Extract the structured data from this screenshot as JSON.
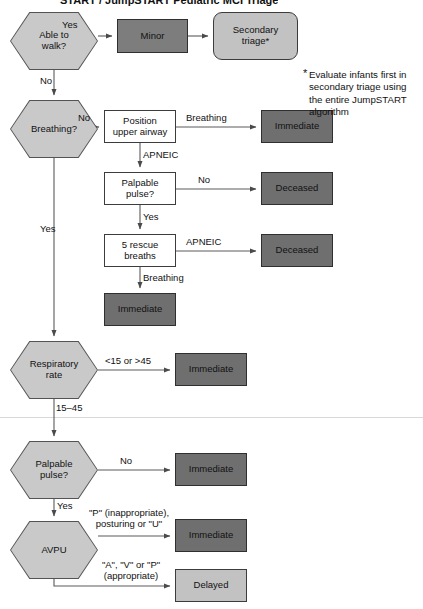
{
  "title": {
    "text": "START / JumpSTART Pediatric MCI Triage"
  },
  "footnote": {
    "marker": "*",
    "text": "Evaluate infants first in\nsecondary triage using\nthe entire JumpSTART\nalgorithm"
  },
  "colors": {
    "decision_fill": "#c9c9c9",
    "process_fill": "#ffffff",
    "immediate_fill": "#6f6f6f",
    "minor_fill": "#7d7d7d",
    "deceased_fill": "#6f6f6f",
    "delayed_fill": "#c2c2c2",
    "secondary_triage_fill": "#c2c2c2",
    "stroke": "#3c3c3c",
    "wire": "#5a5a5a",
    "text": "#111111",
    "background": "#ffffff"
  },
  "nodes": [
    {
      "id": "able-to-walk",
      "label": "Able to\nwalk?",
      "shape": "hexagon",
      "x": 10,
      "y": 12,
      "w": 88,
      "h": 58
    },
    {
      "id": "minor",
      "label": "Minor",
      "shape": "rect-mid",
      "x": 117,
      "y": 19,
      "w": 71,
      "h": 34
    },
    {
      "id": "secondary-triage",
      "label": "Secondary\ntriage*",
      "shape": "rect-rounded",
      "x": 213,
      "y": 12,
      "w": 85,
      "h": 48
    },
    {
      "id": "breathing",
      "label": "Breathing?",
      "shape": "hexagon",
      "x": 10,
      "y": 100,
      "w": 88,
      "h": 58
    },
    {
      "id": "position-airway",
      "label": "Position\nupper airway",
      "shape": "rect-plain",
      "x": 104,
      "y": 110,
      "w": 72,
      "h": 33
    },
    {
      "id": "immediate-1",
      "label": "Immediate",
      "shape": "rect-dark",
      "x": 261,
      "y": 110,
      "w": 72,
      "h": 33
    },
    {
      "id": "palpable-pulse-1",
      "label": "Palpable\npulse?",
      "shape": "rect-plain",
      "x": 104,
      "y": 172,
      "w": 72,
      "h": 33
    },
    {
      "id": "deceased-1",
      "label": "Deceased",
      "shape": "rect-dark",
      "x": 261,
      "y": 172,
      "w": 72,
      "h": 33
    },
    {
      "id": "five-rescue",
      "label": "5 rescue\nbreaths",
      "shape": "rect-plain",
      "x": 104,
      "y": 234,
      "w": 72,
      "h": 33
    },
    {
      "id": "deceased-2",
      "label": "Deceased",
      "shape": "rect-dark",
      "x": 261,
      "y": 234,
      "w": 72,
      "h": 33
    },
    {
      "id": "immediate-2",
      "label": "Immediate",
      "shape": "rect-dark",
      "x": 104,
      "y": 293,
      "w": 72,
      "h": 33
    },
    {
      "id": "respiratory-rate",
      "label": "Respiratory\nrate",
      "shape": "hexagon",
      "x": 10,
      "y": 341,
      "w": 88,
      "h": 58
    },
    {
      "id": "immediate-3",
      "label": "Immediate",
      "shape": "rect-dark",
      "x": 175,
      "y": 353,
      "w": 72,
      "h": 33
    },
    {
      "id": "palpable-pulse-2",
      "label": "Palpable\npulse?",
      "shape": "hexagon",
      "x": 10,
      "y": 441,
      "w": 88,
      "h": 58
    },
    {
      "id": "immediate-4",
      "label": "Immediate",
      "shape": "rect-dark",
      "x": 175,
      "y": 453,
      "w": 72,
      "h": 33
    },
    {
      "id": "avpu",
      "label": "AVPU",
      "shape": "hexagon",
      "x": 10,
      "y": 521,
      "w": 88,
      "h": 58
    },
    {
      "id": "immediate-5",
      "label": "Immediate",
      "shape": "rect-dark",
      "x": 175,
      "y": 519,
      "w": 72,
      "h": 33
    },
    {
      "id": "delayed",
      "label": "Delayed",
      "shape": "rect-light",
      "x": 175,
      "y": 569,
      "w": 72,
      "h": 33
    }
  ],
  "edge_labels": [
    {
      "id": "lbl-yes-walk",
      "text": "Yes",
      "x": 62,
      "y": 20,
      "align": "left"
    },
    {
      "id": "lbl-no-walk",
      "text": "No",
      "x": 40,
      "y": 76,
      "align": "left"
    },
    {
      "id": "lbl-no-breathing",
      "text": "No",
      "x": 78,
      "y": 113,
      "align": "left"
    },
    {
      "id": "lbl-breathing-1",
      "text": "Breathing",
      "x": 186,
      "y": 113,
      "align": "left"
    },
    {
      "id": "lbl-apneic-1",
      "text": "APNEIC",
      "x": 143,
      "y": 150,
      "align": "left"
    },
    {
      "id": "lbl-no-pulse-1",
      "text": "No",
      "x": 198,
      "y": 175,
      "align": "left"
    },
    {
      "id": "lbl-yes-pulse-1",
      "text": "Yes",
      "x": 143,
      "y": 212,
      "align": "left"
    },
    {
      "id": "lbl-apneic-2",
      "text": "APNEIC",
      "x": 186,
      "y": 237,
      "align": "left"
    },
    {
      "id": "lbl-breathing-2",
      "text": "Breathing",
      "x": 143,
      "y": 273,
      "align": "left"
    },
    {
      "id": "lbl-yes-breathing",
      "text": "Yes",
      "x": 40,
      "y": 224,
      "align": "left"
    },
    {
      "id": "lbl-rr-abnormal",
      "text": "<15 or >45",
      "x": 105,
      "y": 356,
      "align": "left"
    },
    {
      "id": "lbl-rr-normal",
      "text": "15–45",
      "x": 56,
      "y": 403,
      "align": "left"
    },
    {
      "id": "lbl-no-pulse-2",
      "text": "No",
      "x": 120,
      "y": 456,
      "align": "left"
    },
    {
      "id": "lbl-yes-pulse-2",
      "text": "Yes",
      "x": 57,
      "y": 501,
      "align": "left"
    },
    {
      "id": "lbl-avpu-immediate",
      "text": "\"P\" (inappropriate),\nposturing or \"U\"",
      "x": 86,
      "y": 508,
      "align": "left"
    },
    {
      "id": "lbl-avpu-delayed",
      "text": "\"A\", \"V\" or \"P\"\n(appropriate)",
      "x": 94,
      "y": 560,
      "align": "left"
    }
  ],
  "divider": {
    "y": 417
  }
}
